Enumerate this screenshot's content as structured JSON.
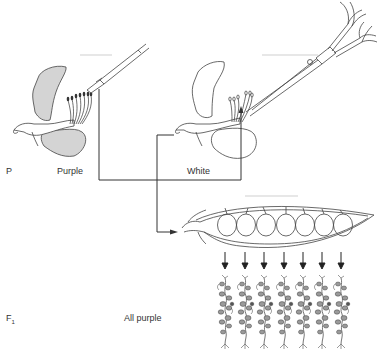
{
  "diagram": {
    "title": "",
    "generations": [
      {
        "id": "P",
        "label": "P",
        "description": "Parental cross"
      },
      {
        "id": "F1",
        "label": "F",
        "subscript": "1",
        "description": "First filial generation"
      }
    ],
    "parents": [
      {
        "name": "purple-flower",
        "label": "Purple",
        "fill": "#d4d4d4",
        "tool": "brush"
      },
      {
        "name": "white-flower",
        "label": "White",
        "fill": "#ffffff",
        "tool": "scissors"
      }
    ],
    "offspring": {
      "label": "All purple",
      "seed_count": 7,
      "plant_count": 7
    },
    "colors": {
      "line": "#333333",
      "purple_petal_fill": "#d4d4d4",
      "white_petal_fill": "#ffffff"
    }
  }
}
